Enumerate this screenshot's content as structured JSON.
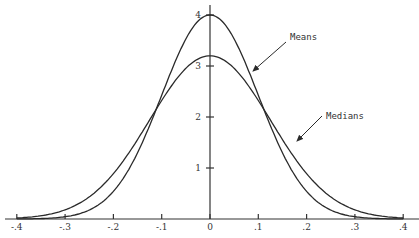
{
  "chart_data": {
    "type": "line",
    "title": "",
    "xlabel": "",
    "ylabel": "",
    "xlim": [
      -0.4,
      0.4
    ],
    "ylim": [
      0,
      4
    ],
    "grid": false,
    "x_ticks": [
      "-.4",
      "-.3",
      "-.2",
      "-.1",
      "0",
      ".1",
      ".2",
      ".3",
      ".4"
    ],
    "y_ticks": [
      "1",
      "2",
      "3",
      "4"
    ],
    "series": [
      {
        "name": "Means",
        "peak": 4.0,
        "sd": 0.1,
        "x": [
          -0.4,
          -0.3,
          -0.2,
          -0.1,
          0,
          0.1,
          0.2,
          0.3,
          0.4
        ],
        "values": [
          0.0,
          0.04,
          0.54,
          2.42,
          4.0,
          2.42,
          0.54,
          0.04,
          0.0
        ]
      },
      {
        "name": "Medians",
        "peak": 3.2,
        "sd": 0.125,
        "x": [
          -0.4,
          -0.3,
          -0.2,
          -0.1,
          0,
          0.1,
          0.2,
          0.3,
          0.4
        ],
        "values": [
          0.02,
          0.18,
          0.89,
          2.3,
          3.2,
          2.3,
          0.89,
          0.18,
          0.02
        ]
      }
    ],
    "annotations": [
      {
        "text": "Means",
        "arrow_to_series": "Means"
      },
      {
        "text": "Medians",
        "arrow_to_series": "Medians"
      }
    ]
  },
  "labels": {
    "means": "Means",
    "medians": "Medians"
  }
}
